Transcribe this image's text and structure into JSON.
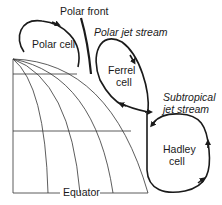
{
  "diagram": {
    "labels": {
      "polar_front": "Polar front",
      "polar_jet_stream": "Polar jet stream",
      "polar_cell": "Polar cell",
      "ferrel_cell_line1": "Ferrel",
      "ferrel_cell_line2": "cell",
      "subtropical_line1": "Subtropical",
      "subtropical_line2": "jet stream",
      "hadley_cell_line1": "Hadley",
      "hadley_cell_line2": "cell",
      "equator": "Equator"
    },
    "colors": {
      "line": "#1a1a1a",
      "thin_line": "#333333",
      "background": "#ffffff"
    }
  }
}
